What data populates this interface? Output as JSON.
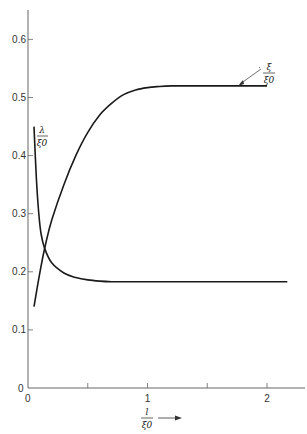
{
  "chart_data": {
    "type": "line",
    "title": "",
    "xlabel": "l / ξ0",
    "ylabel": "",
    "xlim": [
      0,
      2.3
    ],
    "ylim": [
      0,
      0.65
    ],
    "grid": false,
    "legend": "inline curve labels",
    "x_ticks": [
      0,
      0.5,
      1,
      1.5,
      2
    ],
    "x_tick_labels": [
      "0",
      "",
      "1",
      "",
      "2"
    ],
    "y_ticks": [
      0,
      0.1,
      0.2,
      0.3,
      0.4,
      0.5,
      0.6
    ],
    "y_tick_labels": [
      "0",
      "0.1",
      "0.2",
      "0.3",
      "0.4",
      "0.5",
      "0.6"
    ],
    "series": [
      {
        "name": "ξ/ξ0",
        "label_num": "ξ",
        "label_den": "ξ0",
        "x": [
          0.05,
          0.1,
          0.15,
          0.2,
          0.3,
          0.4,
          0.5,
          0.6,
          0.7,
          0.8,
          0.9,
          1.0,
          1.1,
          1.2,
          1.3,
          1.5,
          1.7,
          2.0
        ],
        "values": [
          0.14,
          0.2,
          0.25,
          0.29,
          0.35,
          0.4,
          0.44,
          0.47,
          0.49,
          0.505,
          0.513,
          0.517,
          0.519,
          0.52,
          0.52,
          0.52,
          0.52,
          0.52
        ]
      },
      {
        "name": "λ/ξ0",
        "label_num": "λ",
        "label_den": "ξ0",
        "x": [
          0.05,
          0.07,
          0.09,
          0.11,
          0.14,
          0.2,
          0.3,
          0.4,
          0.5,
          0.6,
          0.7,
          0.8,
          1.0,
          1.5,
          2.0,
          2.17
        ],
        "values": [
          0.45,
          0.36,
          0.3,
          0.265,
          0.24,
          0.215,
          0.198,
          0.19,
          0.186,
          0.184,
          0.183,
          0.183,
          0.183,
          0.183,
          0.183,
          0.183
        ]
      }
    ],
    "annotations": [
      {
        "text": "ξ/ξ0",
        "pointer": "arrow to end of upper curve near l/ξ0 = 2"
      },
      {
        "text": "λ/ξ0",
        "position": "next to start of decreasing curve near l/ξ0 = 0.05"
      },
      {
        "text": "l/ξ0 →",
        "position": "x-axis label with arrow"
      }
    ]
  },
  "axis": {
    "origin_x": "0",
    "origin_y": "0",
    "xlabel_num": "l",
    "xlabel_den": "ξ0"
  }
}
